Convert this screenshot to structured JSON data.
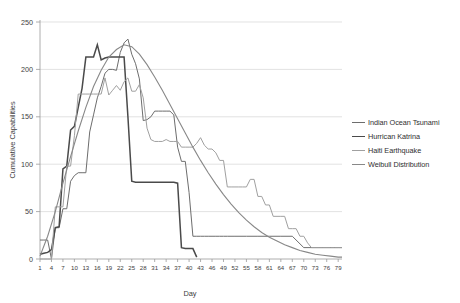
{
  "chart_data": {
    "type": "line",
    "title": "",
    "xlabel": "Day",
    "ylabel": "Cumulative  Capabilities",
    "xlim": [
      1,
      80
    ],
    "ylim": [
      0,
      250
    ],
    "yticks": [
      0,
      50,
      100,
      150,
      200,
      250
    ],
    "xticks": [
      1,
      4,
      7,
      10,
      13,
      16,
      19,
      22,
      25,
      28,
      31,
      34,
      37,
      40,
      43,
      46,
      49,
      52,
      55,
      58,
      61,
      64,
      67,
      70,
      73,
      76,
      79
    ],
    "grid": true,
    "legend_position": "right",
    "series": [
      {
        "name": "Indian Ocean Tsunami",
        "color": "#6d6d6d",
        "width": 1.0,
        "x": [
          1,
          2,
          3,
          4,
          5,
          6,
          7,
          8,
          9,
          10,
          11,
          12,
          13,
          14,
          15,
          16,
          17,
          18,
          19,
          20,
          21,
          22,
          23,
          24,
          25,
          26,
          27,
          28,
          29,
          30,
          31,
          32,
          33,
          34,
          35,
          36,
          37,
          38,
          39,
          40,
          41,
          42,
          43,
          44,
          45,
          46,
          47,
          48,
          49,
          50,
          52,
          55,
          58,
          61,
          64,
          67,
          70,
          73,
          76,
          79,
          80
        ],
        "values": [
          20,
          20,
          20,
          0,
          33,
          33,
          53,
          53,
          82,
          88,
          91,
          91,
          91,
          134,
          152,
          170,
          182,
          196,
          200,
          200,
          199,
          218,
          228,
          232,
          216,
          206,
          190,
          146,
          147,
          150,
          156,
          156,
          156,
          156,
          156,
          152,
          118,
          103,
          103,
          70,
          24,
          24,
          24,
          24,
          24,
          24,
          24,
          24,
          24,
          24,
          24,
          24,
          24,
          24,
          24,
          24,
          12,
          12,
          12,
          12,
          12
        ]
      },
      {
        "name": "Hurrican Katrina",
        "color": "#4a4a4a",
        "width": 1.5,
        "x": [
          1,
          2,
          3,
          4,
          5,
          6,
          7,
          8,
          9,
          10,
          11,
          12,
          13,
          14,
          15,
          16,
          17,
          18,
          19,
          20,
          21,
          22,
          23,
          24,
          25,
          26,
          27,
          28,
          29,
          30,
          31,
          32,
          33,
          34,
          35,
          36,
          37,
          38,
          39,
          40,
          41,
          42
        ],
        "values": [
          5,
          6,
          7,
          10,
          33,
          34,
          95,
          98,
          136,
          140,
          160,
          180,
          213,
          213,
          213,
          226,
          210,
          212,
          213,
          213,
          213,
          213,
          213,
          150,
          82,
          81,
          81,
          81,
          81,
          81,
          81,
          81,
          81,
          81,
          81,
          81,
          80,
          12,
          11,
          11,
          11,
          2
        ]
      },
      {
        "name": "Haiti Earthquake",
        "color": "#a0a0a0",
        "width": 1.0,
        "x": [
          1,
          2,
          3,
          4,
          5,
          6,
          7,
          8,
          9,
          10,
          11,
          12,
          13,
          14,
          15,
          16,
          17,
          18,
          19,
          20,
          21,
          22,
          23,
          24,
          25,
          26,
          27,
          28,
          29,
          30,
          31,
          32,
          33,
          34,
          35,
          36,
          37,
          38,
          39,
          40,
          41,
          42,
          43,
          44,
          45,
          46,
          47,
          48,
          49,
          50,
          51,
          52,
          53,
          54,
          55,
          56,
          57,
          58,
          59,
          60,
          61,
          62,
          63,
          64,
          65,
          66,
          67,
          68,
          69,
          70,
          71,
          72,
          73,
          74,
          75,
          76,
          77,
          78,
          79,
          80
        ],
        "values": [
          0,
          0,
          0,
          0,
          55,
          55,
          55,
          98,
          98,
          130,
          174,
          174,
          174,
          174,
          174,
          174,
          174,
          191,
          173,
          178,
          183,
          178,
          187,
          191,
          177,
          177,
          184,
          170,
          138,
          126,
          124,
          124,
          124,
          126,
          124,
          124,
          124,
          118,
          118,
          118,
          118,
          122,
          128,
          120,
          116,
          116,
          112,
          104,
          104,
          76,
          76,
          76,
          76,
          76,
          76,
          84,
          84,
          66,
          66,
          57,
          57,
          45,
          45,
          45,
          45,
          32,
          32,
          32,
          24,
          24,
          17,
          12,
          12,
          12,
          12,
          12,
          12,
          12,
          12,
          12
        ]
      },
      {
        "name": "Weibull Distribution",
        "color": "#888888",
        "width": 1.1,
        "x": [
          1,
          3,
          5,
          7,
          9,
          11,
          13,
          15,
          17,
          19,
          21,
          23,
          25,
          27,
          29,
          31,
          33,
          35,
          37,
          39,
          41,
          43,
          45,
          47,
          49,
          51,
          53,
          55,
          57,
          59,
          61,
          63,
          65,
          67,
          69,
          71,
          73,
          75,
          77,
          79,
          80
        ],
        "values": [
          3,
          24,
          50,
          80,
          108,
          135,
          160,
          182,
          199,
          213,
          221,
          226,
          224,
          216,
          205,
          192,
          178,
          163,
          148,
          133,
          118,
          104,
          91,
          79,
          68,
          58,
          49,
          41,
          34,
          28,
          23,
          19,
          15,
          12,
          9,
          7,
          5,
          4,
          3,
          2,
          2
        ]
      }
    ]
  },
  "legend": {
    "items": [
      {
        "label": "Indian Ocean Tsunami",
        "color": "#6d6d6d",
        "width": 1.0
      },
      {
        "label": "Hurrican Katrina",
        "color": "#4a4a4a",
        "width": 1.6
      },
      {
        "label": "Haiti Earthquake",
        "color": "#a0a0a0",
        "width": 1.0
      },
      {
        "label": "Weibull Distribution",
        "color": "#888888",
        "width": 1.2
      }
    ]
  }
}
